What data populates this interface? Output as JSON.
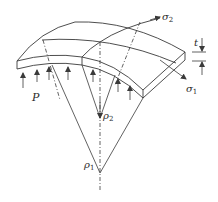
{
  "diagram": {
    "type": "shell-element-stress",
    "labels": {
      "sigma2": {
        "main": "σ",
        "sub": "2"
      },
      "sigma1": {
        "main": "σ",
        "sub": "1"
      },
      "thickness": {
        "main": "t"
      },
      "pressure": {
        "main": "P"
      },
      "rho2": {
        "main": "ρ",
        "sub": "2"
      },
      "rho1": {
        "main": "ρ",
        "sub": "1"
      }
    },
    "colors": {
      "line": "#3a3a3a",
      "background": "#ffffff"
    },
    "pressure_arrow_count": 7
  }
}
